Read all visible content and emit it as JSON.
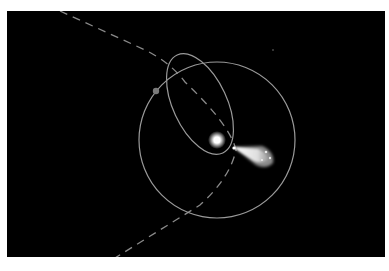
{
  "diagram": {
    "background": "#000000",
    "frame": {
      "x": 7,
      "y": 11,
      "width": 378,
      "height": 246
    },
    "line_color": "#9a9a9a",
    "sun": {
      "cx": 217,
      "cy": 140,
      "r": 5,
      "color": "#ffffff"
    },
    "planet_orbit": {
      "cx": 217,
      "cy": 140,
      "rx": 79,
      "ry": 77
    },
    "comet_orbit": {
      "cx": 200,
      "cy": 104,
      "rx": 27,
      "ry": 54,
      "rotation": -25
    },
    "planet": {
      "cx": 156,
      "cy": 91,
      "r": 3,
      "color": "#7a7a7a"
    },
    "comet": {
      "head_x": 234,
      "head_y": 148,
      "tail_end_x": 272,
      "tail_end_y": 163
    },
    "star": {
      "cx": 273,
      "cy": 50,
      "r": 0.8
    },
    "hyperbolic_path": "M 60 11 L 145 50 Q 170 62 185 82 Q 230 125 236 150 Q 230 178 200 205 L 115 258"
  }
}
